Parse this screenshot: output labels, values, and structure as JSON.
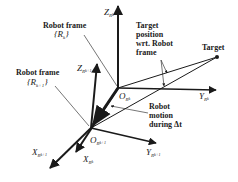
{
  "diagram": {
    "type": "coordinate-frame-diagram",
    "labels": {
      "robot_frame_k_title": "Robot frame",
      "robot_frame_k_sym": "{R",
      "robot_frame_k_sub": "k",
      "robot_frame_k_close": "}",
      "robot_frame_k1_title": "Robot frame",
      "robot_frame_k1_sym": "{R",
      "robot_frame_k1_sub": "k+1",
      "robot_frame_k1_close": "}",
      "target_pos_line1": "Target",
      "target_pos_line2": "position",
      "target_pos_line3": "wrt. Robot",
      "target_pos_line4": "frame",
      "target": "Target",
      "motion_line1": "Robot",
      "motion_line2": "motion",
      "motion_line3": "during Δt",
      "z_rk": "Z",
      "z_rk_sub": "R",
      "z_rk_subsub": "k",
      "z_rk1": "Z",
      "z_rk1_sub": "R",
      "z_rk1_subsub": "k+1",
      "y_rk": "Y",
      "y_rk_sub": "R",
      "y_rk_subsub": "k",
      "y_rk1": "Y",
      "y_rk1_sub": "R",
      "y_rk1_subsub": "k+1",
      "x_rk": "X",
      "x_rk_sub": "R",
      "x_rk_subsub": "k",
      "x_rk1": "X",
      "x_rk1_sub": "R",
      "x_rk1_subsub": "k+1",
      "o_rk": "O",
      "o_rk_sub": "R",
      "o_rk_subsub": "k",
      "o_rk1": "O",
      "o_rk1_sub": "R",
      "o_rk1_subsub": "k+1"
    },
    "colors": {
      "ink": "#1a1a1a",
      "background": "#ffffff"
    }
  }
}
